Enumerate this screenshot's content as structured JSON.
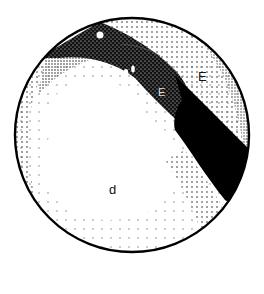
{
  "figure": {
    "type": "stippled-circle-diagram",
    "labels": {
      "upper_region": "E",
      "lower_region": "d",
      "band_label": "E"
    },
    "colors": {
      "ink": "#000000",
      "paper": "#ffffff"
    }
  }
}
